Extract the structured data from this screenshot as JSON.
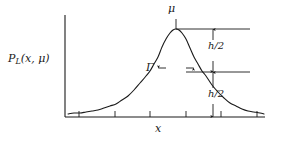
{
  "figure": {
    "kind": "lorentzian-distribution-plot",
    "background_color": "#ffffff",
    "ink_color": "#1a1a1a",
    "curve_color": "#1a1a1a"
  },
  "labels": {
    "y_axis": "P",
    "y_axis_subscript": "L",
    "y_axis_args": "(x, μ)",
    "x_axis": "x",
    "peak": "μ",
    "fwhm": "Γ",
    "half_height_upper": "h/2",
    "half_height_lower": "h/2"
  },
  "chart_data": {
    "type": "line",
    "title": "",
    "xlabel": "x",
    "ylabel": "P_L(x, μ)",
    "grid": false,
    "legend": null,
    "xlim": [
      0,
      1
    ],
    "ylim": [
      0,
      1
    ],
    "axes": {
      "x_axis_y_px": 117,
      "x_axis_x_start_px": 65,
      "x_axis_x_end_px": 265,
      "y_axis_x_px": 65,
      "y_axis_y_top_px": 15,
      "y_axis_y_bottom_px": 117,
      "x_ticks_px": [
        79,
        115,
        150,
        186,
        221,
        257
      ],
      "x_tick_labels": [],
      "y_ticks_px": [],
      "y_tick_labels": []
    },
    "curve": {
      "name": "Lorentzian P_L(x, μ)",
      "peak_x_px": 176,
      "peak_y_px": 29,
      "half_max_y_px": 72,
      "baseline_y_px": 117,
      "gamma_left_x_px": 158,
      "gamma_right_x_px": 194,
      "x_px": [
        68,
        74,
        80,
        86,
        92,
        98,
        104,
        110,
        116,
        122,
        128,
        134,
        140,
        146,
        150,
        154,
        158,
        162,
        166,
        170,
        173,
        176,
        179,
        182,
        186,
        190,
        194,
        198,
        202,
        206,
        212,
        218,
        224,
        230,
        236,
        242,
        248,
        254,
        260,
        264
      ],
      "y_px": [
        114,
        113,
        113,
        112,
        111,
        110,
        108,
        106,
        104,
        100,
        96,
        90,
        83,
        76,
        71,
        64,
        57,
        47,
        39,
        33,
        30,
        29,
        30,
        33,
        39,
        48,
        57,
        64,
        71,
        76,
        85,
        92,
        98,
        103,
        106,
        109,
        111,
        112,
        113,
        114
      ]
    },
    "annotations": [
      {
        "name": "peak-marker",
        "label": "μ",
        "type": "tick-and-label",
        "x_px": 176,
        "y_px": 29,
        "tick_top_y_px": 19,
        "label_x_px": 173,
        "label_y_px": 6
      },
      {
        "name": "peak-level-line",
        "type": "horizontal-rule",
        "x_start_px": 176,
        "x_end_px": 250,
        "y_px": 29
      },
      {
        "name": "half-max-level-line",
        "type": "horizontal-rule",
        "x_start_px": 186,
        "x_end_px": 250,
        "y_px": 72
      },
      {
        "name": "fwhm-arrow",
        "label": "Γ",
        "type": "double-arrow-horizontal",
        "x_start_px": 158,
        "x_end_px": 194,
        "y_px": 68,
        "label_x_px": 152,
        "label_y_px": 62
      },
      {
        "name": "upper-half-height-arrow",
        "label": "h/2",
        "type": "double-arrow-vertical",
        "x_px": 213,
        "y_start_px": 29,
        "y_end_px": 72,
        "label_x_px": 208,
        "label_y_px": 41
      },
      {
        "name": "lower-half-height-arrow",
        "label": "h/2",
        "type": "double-arrow-vertical",
        "x_px": 213,
        "y_start_px": 72,
        "y_end_px": 117,
        "label_x_px": 208,
        "label_y_px": 89
      }
    ]
  }
}
